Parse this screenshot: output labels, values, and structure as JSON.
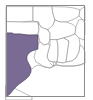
{
  "figure": {
    "kind": "range-map-thumbnail",
    "width": 93,
    "height": 100,
    "background_color": "#ffffff"
  },
  "frame": {
    "visible": true,
    "color": "#8c8c8c",
    "x": 6,
    "y": 5,
    "width": 79,
    "height": 92
  },
  "style": {
    "land_fill": "#ffffff",
    "boundary_color": "#8f8f8f",
    "highlight_fill": "#7a6b94",
    "highlight_stroke": "#4a4060",
    "water_fill": "#ffffff"
  },
  "legend": {
    "highlight_label": "Range",
    "highlight_color": "#7a6b94"
  },
  "regions": [
    {
      "name": "Texas",
      "highlighted": true,
      "fill": "#7a6b94"
    },
    {
      "name": "Oklahoma",
      "highlighted": false,
      "fill": "#ffffff"
    },
    {
      "name": "Kansas",
      "highlighted": false,
      "fill": "#ffffff"
    },
    {
      "name": "Missouri",
      "highlighted": false,
      "fill": "#ffffff"
    },
    {
      "name": "Arkansas",
      "highlighted": false,
      "fill": "#ffffff"
    },
    {
      "name": "Louisiana",
      "highlighted": false,
      "fill": "#ffffff"
    },
    {
      "name": "Mississippi",
      "highlighted": false,
      "fill": "#ffffff"
    },
    {
      "name": "Alabama",
      "highlighted": false,
      "fill": "#ffffff"
    },
    {
      "name": "Tennessee",
      "highlighted": false,
      "fill": "#ffffff"
    },
    {
      "name": "Kentucky",
      "highlighted": false,
      "fill": "#ffffff"
    },
    {
      "name": "Georgia",
      "highlighted": false,
      "fill": "#ffffff"
    },
    {
      "name": "Florida",
      "highlighted": false,
      "fill": "#ffffff"
    },
    {
      "name": "South Carolina",
      "highlighted": false,
      "fill": "#ffffff"
    },
    {
      "name": "North Carolina",
      "highlighted": false,
      "fill": "#ffffff"
    },
    {
      "name": "Gulf of Mexico",
      "highlighted": false,
      "fill": "#ffffff"
    }
  ]
}
